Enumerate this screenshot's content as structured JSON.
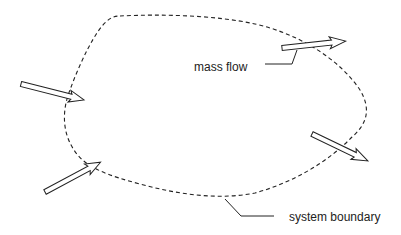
{
  "diagram": {
    "type": "control-volume",
    "colors": {
      "background": "#ffffff",
      "stroke": "#222222"
    },
    "labels": {
      "mass_flow": "mass flow",
      "system_boundary": "system boundary"
    },
    "arrows": [
      {
        "id": "inflow-left",
        "direction": "in"
      },
      {
        "id": "inflow-bottom-left",
        "direction": "in"
      },
      {
        "id": "outflow-top-right",
        "direction": "out"
      },
      {
        "id": "outflow-right",
        "direction": "out"
      }
    ]
  }
}
